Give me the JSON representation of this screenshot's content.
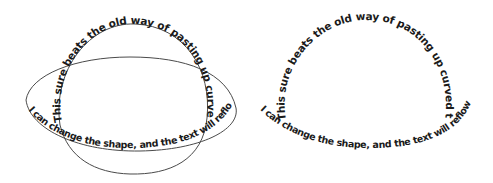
{
  "panels": [
    {
      "id": "with-paths",
      "paths_visible": true,
      "outer_text": "This sure beats the old way of pasting up curved type!",
      "inner_text": "I can change the shape, and the text will reflow. Cool!"
    },
    {
      "id": "paths-hidden",
      "paths_visible": false,
      "outer_text": "This sure beats the old way of pasting up curved type!",
      "inner_text": "I can change the shape, and the text will reflow. Cool!"
    }
  ],
  "colors": {
    "text": "#1a1a1a",
    "path_stroke": "#4a4a4a",
    "background": "#ffffff"
  }
}
